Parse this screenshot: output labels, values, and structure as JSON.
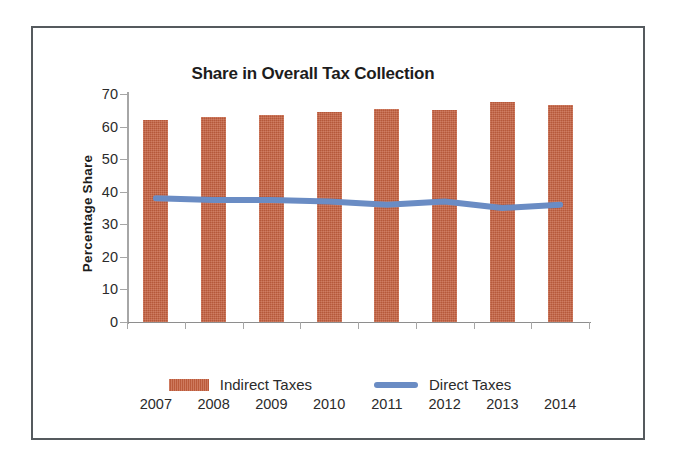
{
  "chart_data": {
    "type": "bar",
    "title": "Share in Overall Tax Collection",
    "xlabel": "",
    "ylabel": "Percentage  Share",
    "categories": [
      "2007",
      "2008",
      "2009",
      "2010",
      "2011",
      "2012",
      "2013",
      "2014"
    ],
    "ylim": [
      0,
      70
    ],
    "y_ticks": [
      "70",
      "60",
      "50",
      "40",
      "30",
      "20",
      "10",
      "0"
    ],
    "grid": false,
    "legend_position": "bottom",
    "series": [
      {
        "name": "Indirect Taxes",
        "type": "bar",
        "color": "#c5603f",
        "values": [
          62,
          63,
          63.5,
          64.5,
          65.5,
          65,
          67.5,
          66.5
        ]
      },
      {
        "name": "Direct Taxes",
        "type": "line",
        "color": "#6a8cc4",
        "values": [
          38,
          37.5,
          37.5,
          37,
          36,
          37,
          35,
          36
        ]
      }
    ]
  }
}
